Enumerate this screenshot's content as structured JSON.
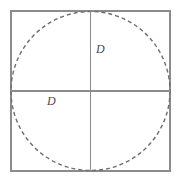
{
  "figure": {
    "background_color": "#ffffff",
    "labels": {
      "upper_right": "D",
      "lower_left": "D"
    },
    "colors": {
      "square_stroke": "#8c8c8c",
      "circle_stroke": "#6e6e6e",
      "diameter_stroke": "#8c8c8c",
      "label_text": "#4a4a4a"
    },
    "geometry": {
      "square": {
        "x": 11,
        "y": 11,
        "width": 159,
        "height": 160,
        "stroke_width": 1.4,
        "dashed": false
      },
      "circle": {
        "cx": 90.5,
        "cy": 91,
        "r": 79.5,
        "stroke_width": 1.4,
        "dashed": true,
        "dash_pattern": "4 3"
      },
      "horizontal_diameter": {
        "x1": 11,
        "y1": 91,
        "x2": 170,
        "y2": 91,
        "stroke_width": 1.2
      },
      "vertical_diameter": {
        "x1": 90.5,
        "y1": 11,
        "x2": 90.5,
        "y2": 171,
        "stroke_width": 1.2
      }
    }
  }
}
